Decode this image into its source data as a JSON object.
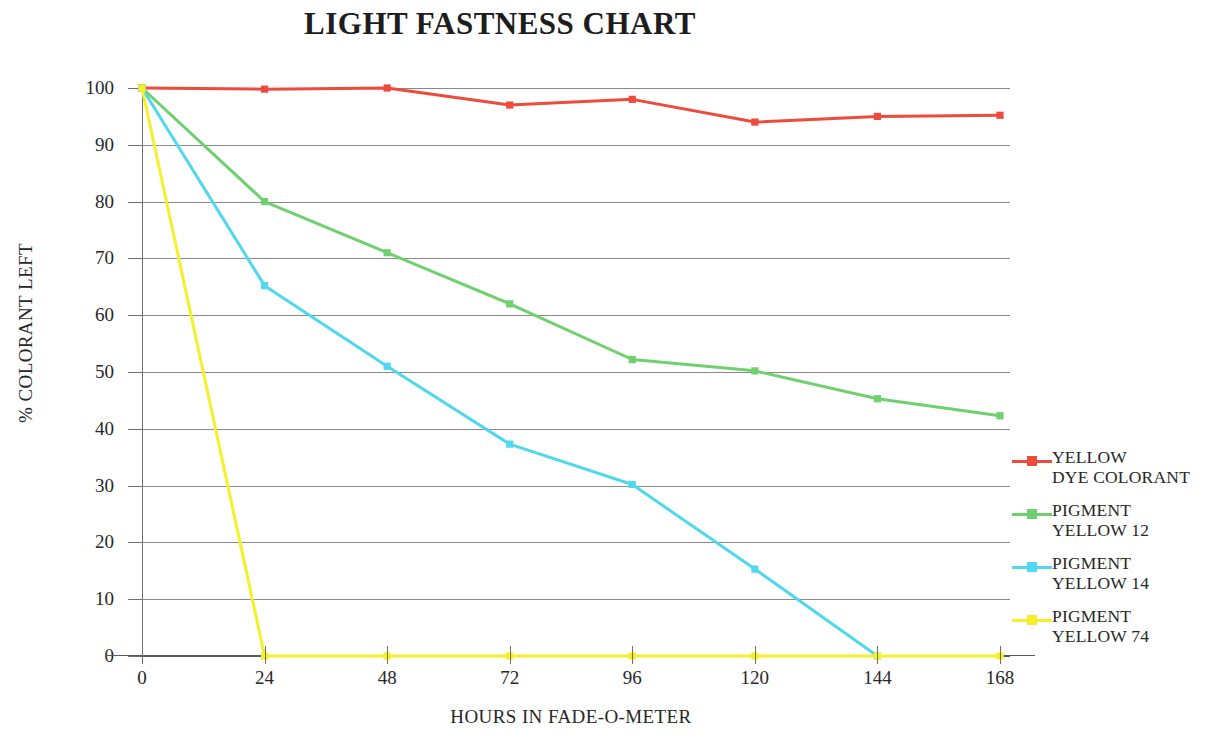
{
  "chart_data": {
    "type": "line",
    "title": "LIGHT FASTNESS CHART",
    "xlabel": "HOURS IN FADE-O-METER",
    "ylabel": "% COLORANT LEFT",
    "x": [
      0,
      24,
      48,
      72,
      96,
      120,
      144,
      168
    ],
    "xticklabels": [
      "0",
      "24",
      "48",
      "72",
      "96",
      "120",
      "144",
      "168"
    ],
    "yticklabels": [
      "0",
      "10",
      "20",
      "30",
      "40",
      "50",
      "60",
      "70",
      "80",
      "90",
      "100"
    ],
    "yticks": [
      0,
      10,
      20,
      30,
      40,
      50,
      60,
      70,
      80,
      90,
      100
    ],
    "xlim": [
      0,
      168
    ],
    "ylim": [
      0,
      100
    ],
    "grid": "horizontal",
    "legend_position": "right",
    "markers": "square",
    "series": [
      {
        "name": "YELLOW\nDYE COLORANT",
        "color": "#EE4B3C",
        "x": [
          0,
          24,
          48,
          72,
          96,
          120,
          144,
          168
        ],
        "values": [
          100,
          99.8,
          100,
          97,
          98,
          94,
          95,
          95.2
        ]
      },
      {
        "name": "PIGMENT\nYELLOW 12",
        "color": "#6ED16E",
        "x": [
          0,
          24,
          48,
          72,
          96,
          120,
          144,
          168
        ],
        "values": [
          100,
          80,
          71,
          62,
          52.2,
          50.2,
          45.3,
          42.3
        ]
      },
      {
        "name": "PIGMENT\nYELLOW 14",
        "color": "#4FD8EE",
        "x": [
          0,
          24,
          48,
          72,
          96,
          120,
          144
        ],
        "values": [
          100,
          65.2,
          51,
          37.3,
          30.2,
          15.3,
          0
        ]
      },
      {
        "name": "PIGMENT\nYELLOW 74",
        "color": "#F5F02A",
        "x": [
          0,
          24,
          48,
          72,
          96,
          120,
          144,
          168
        ],
        "values": [
          100,
          0,
          0,
          0,
          0,
          0,
          0,
          0
        ]
      }
    ]
  },
  "legend": {
    "items": [
      {
        "label": "YELLOW\nDYE COLORANT",
        "color": "#EE4B3C"
      },
      {
        "label": "PIGMENT\nYELLOW 12",
        "color": "#6ED16E"
      },
      {
        "label": "PIGMENT\nYELLOW 14",
        "color": "#4FD8EE"
      },
      {
        "label": "PIGMENT\nYELLOW 74",
        "color": "#F5F02A"
      }
    ]
  }
}
